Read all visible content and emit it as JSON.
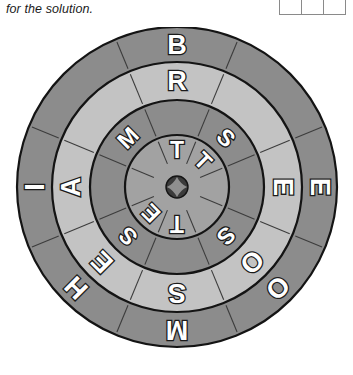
{
  "caption": "for the solution.",
  "answer_boxes": {
    "count": 3,
    "values": [
      "",
      "",
      ""
    ]
  },
  "wheel": {
    "center_hub": {
      "shape": "four-point-star-screw",
      "color": "#3b3b3b"
    },
    "sector_count": 8,
    "rings": [
      {
        "name": "outer-ring",
        "index": 4,
        "fill": "#8c8c8c",
        "letters": [
          {
            "sector": 0,
            "angle": -90,
            "letter": "B"
          },
          {
            "sector": 1,
            "angle": -45,
            "letter": ""
          },
          {
            "sector": 2,
            "angle": 0,
            "letter": "E"
          },
          {
            "sector": 3,
            "angle": 45,
            "letter": "O"
          },
          {
            "sector": 4,
            "angle": 90,
            "letter": "M"
          },
          {
            "sector": 5,
            "angle": 135,
            "letter": "H"
          },
          {
            "sector": 6,
            "angle": 180,
            "letter": "I"
          },
          {
            "sector": 7,
            "angle": -135,
            "letter": ""
          }
        ]
      },
      {
        "name": "ring-three",
        "index": 3,
        "fill": "#c3c3c3",
        "letters": [
          {
            "sector": 0,
            "angle": -90,
            "letter": "R"
          },
          {
            "sector": 1,
            "angle": -45,
            "letter": ""
          },
          {
            "sector": 2,
            "angle": 0,
            "letter": "E"
          },
          {
            "sector": 3,
            "angle": 45,
            "letter": "O"
          },
          {
            "sector": 4,
            "angle": 90,
            "letter": "S"
          },
          {
            "sector": 5,
            "angle": 135,
            "letter": "E"
          },
          {
            "sector": 6,
            "angle": 180,
            "letter": "A"
          },
          {
            "sector": 7,
            "angle": -135,
            "letter": ""
          }
        ]
      },
      {
        "name": "ring-two",
        "index": 2,
        "fill": "#8c8c8c",
        "letters": [
          {
            "sector": 0,
            "angle": -90,
            "letter": ""
          },
          {
            "sector": 1,
            "angle": -45,
            "letter": "S"
          },
          {
            "sector": 2,
            "angle": 0,
            "letter": ""
          },
          {
            "sector": 3,
            "angle": 45,
            "letter": "S"
          },
          {
            "sector": 4,
            "angle": 90,
            "letter": ""
          },
          {
            "sector": 5,
            "angle": 135,
            "letter": "S"
          },
          {
            "sector": 6,
            "angle": 180,
            "letter": ""
          },
          {
            "sector": 7,
            "angle": -135,
            "letter": "M"
          }
        ]
      },
      {
        "name": "inner-ring",
        "index": 1,
        "fill": "#a2a2a2",
        "letters": [
          {
            "sector": 0,
            "angle": -90,
            "letter": "T"
          },
          {
            "sector": 1,
            "angle": -45,
            "letter": "T"
          },
          {
            "sector": 2,
            "angle": 0,
            "letter": ""
          },
          {
            "sector": 3,
            "angle": 45,
            "letter": ""
          },
          {
            "sector": 4,
            "angle": 90,
            "letter": "T"
          },
          {
            "sector": 5,
            "angle": 135,
            "letter": "E"
          },
          {
            "sector": 6,
            "angle": 180,
            "letter": ""
          },
          {
            "sector": 7,
            "angle": -135,
            "letter": ""
          }
        ]
      }
    ]
  }
}
